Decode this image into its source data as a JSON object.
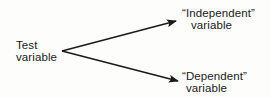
{
  "diagram": {
    "type": "branching-arrow",
    "nodes": {
      "source": {
        "line1": "Test",
        "line2": "variable"
      },
      "upper_target": {
        "line1": "“Independent”",
        "line2": "variable"
      },
      "lower_target": {
        "line1": "“Dependent”",
        "line2": "variable"
      }
    },
    "edges": [
      {
        "from": "source",
        "to": "upper_target"
      },
      {
        "from": "source",
        "to": "lower_target"
      }
    ],
    "colors": {
      "ink": "#1a1a1a",
      "background": "#fdfdfc"
    }
  }
}
